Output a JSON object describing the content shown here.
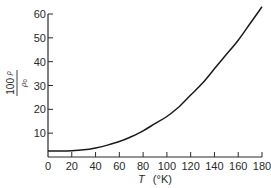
{
  "chart_data": {
    "type": "line",
    "title": "",
    "xlabel_symbol": "T",
    "xlabel_unit": "(°K)",
    "ylabel_numerator": "100 ρ",
    "ylabel_denominator": "ρ0",
    "ylabel_num_main": "100",
    "ylabel_num_sym": "ρ",
    "ylabel_den_sym": "ρ",
    "ylabel_den_sub": "0",
    "xlim": [
      0,
      180
    ],
    "ylim": [
      0,
      60
    ],
    "x_ticks": [
      0,
      20,
      40,
      60,
      80,
      100,
      120,
      140,
      160,
      180
    ],
    "y_ticks": [
      10,
      20,
      30,
      40,
      50,
      60
    ],
    "x_tick_labels": [
      "0",
      "20",
      "40",
      "60",
      "80",
      "100",
      "120",
      "140",
      "160",
      "180"
    ],
    "y_tick_labels": [
      "10",
      "20",
      "30",
      "40",
      "50",
      "60"
    ],
    "grid": false,
    "legend": "none",
    "series": [
      {
        "name": "100ρ/ρ0 vs T",
        "x": [
          0,
          10,
          20,
          30,
          40,
          50,
          60,
          70,
          80,
          90,
          100,
          110,
          120,
          130,
          140,
          150,
          160,
          170,
          180
        ],
        "y": [
          2.5,
          2.5,
          2.6,
          3.0,
          3.8,
          5.0,
          6.5,
          8.5,
          11,
          14,
          17,
          21,
          26,
          31,
          37,
          43,
          49,
          56,
          63
        ]
      }
    ],
    "colors": {
      "line": "#1a1a1a",
      "axis": "#2a2a2a"
    }
  }
}
